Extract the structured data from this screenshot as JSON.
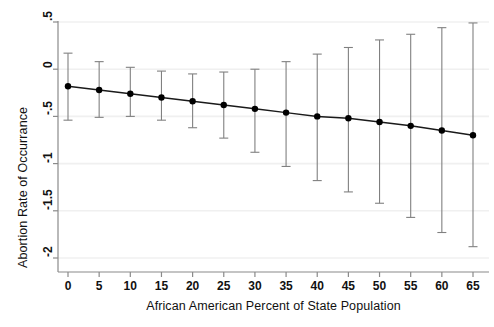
{
  "chart_data": {
    "type": "line",
    "title": "",
    "subtitle": "",
    "xlabel": "African American Percent of State Population",
    "ylabel": "Abortion Rate of Occurrance",
    "xlim": [
      -2,
      67
    ],
    "ylim": [
      -2.0,
      0.5
    ],
    "xticks": [
      0,
      5,
      10,
      15,
      20,
      25,
      30,
      35,
      40,
      45,
      50,
      55,
      60,
      65
    ],
    "xtick_labels": [
      "0",
      "5",
      "10",
      "15",
      "20",
      "25",
      "30",
      "35",
      "40",
      "45",
      "50",
      "55",
      "60",
      "65"
    ],
    "yticks": [
      0.5,
      0,
      -0.5,
      -1,
      -1.5,
      -2
    ],
    "ytick_labels": [
      ".5",
      "0",
      "-.5",
      "-1",
      "-1.5",
      "-2"
    ],
    "grid": "horizontal-faint",
    "legend": "none",
    "marker": "filled-circle",
    "errorbar_caps": true,
    "x": [
      0,
      5,
      10,
      15,
      20,
      25,
      30,
      35,
      40,
      45,
      50,
      55,
      60,
      65
    ],
    "values": [
      -0.18,
      -0.22,
      -0.26,
      -0.3,
      -0.34,
      -0.38,
      -0.42,
      -0.46,
      -0.5,
      -0.52,
      -0.56,
      -0.6,
      -0.65,
      -0.7
    ],
    "error_low": [
      -0.54,
      -0.51,
      -0.5,
      -0.54,
      -0.62,
      -0.73,
      -0.88,
      -1.03,
      -1.18,
      -1.3,
      -1.42,
      -1.57,
      -1.73,
      -1.88
    ],
    "error_high": [
      0.17,
      0.08,
      0.02,
      -0.02,
      -0.05,
      -0.03,
      0.0,
      0.08,
      0.16,
      0.23,
      0.31,
      0.37,
      0.44,
      0.49
    ],
    "series": [
      {
        "name": "Marginal effect",
        "values": [
          -0.18,
          -0.22,
          -0.26,
          -0.3,
          -0.34,
          -0.38,
          -0.42,
          -0.46,
          -0.5,
          -0.52,
          -0.56,
          -0.6,
          -0.65,
          -0.7
        ]
      }
    ]
  },
  "style": {
    "line_color": "#1a1a1a",
    "marker_color": "#000000",
    "errorbar_color": "#808080",
    "axis_color": "#8a8a8a",
    "grid_color": "#f0f0f0",
    "background": "#ffffff",
    "text_color": "#111111"
  }
}
